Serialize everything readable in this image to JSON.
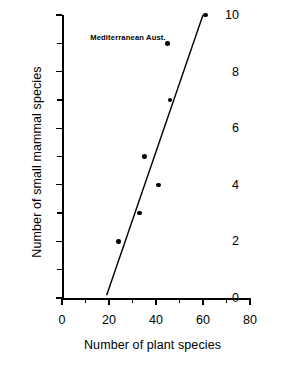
{
  "chart_data": {
    "type": "scatter",
    "title": "",
    "xlabel": "Number of plant species",
    "ylabel": "Number of small mammal species",
    "xlim": [
      0,
      80
    ],
    "ylim": [
      0,
      10
    ],
    "xticks": [
      0,
      20,
      40,
      60,
      80
    ],
    "yticks": [
      0,
      2,
      4,
      6,
      8,
      10
    ],
    "xticklabels": [
      "0",
      "20",
      "40",
      "60",
      "80"
    ],
    "yticklabels": [
      "0",
      "2",
      "4",
      "6",
      "8",
      "10"
    ],
    "xminorticks": [
      10,
      30,
      50,
      70
    ],
    "yminorticks": [
      1,
      3,
      5,
      7,
      9
    ],
    "grid": false,
    "legend": null,
    "annotations": [
      {
        "text": "Mediterranean Aust.",
        "x": 12,
        "y": 9.2
      }
    ],
    "series": [
      {
        "name": "Mediterranean Aust.",
        "marker": "filled-circle",
        "color": "#000000",
        "points": [
          {
            "x": 24,
            "y": 2
          },
          {
            "x": 33,
            "y": 3
          },
          {
            "x": 35,
            "y": 5
          },
          {
            "x": 41,
            "y": 4
          },
          {
            "x": 45,
            "y": 9
          },
          {
            "x": 46,
            "y": 7
          },
          {
            "x": 61,
            "y": 10
          }
        ]
      }
    ],
    "fit_line": {
      "name": "regression-line",
      "color": "#000000",
      "x_start": 19,
      "y_start": 0.1,
      "x_end": 60,
      "y_end": 10
    }
  }
}
